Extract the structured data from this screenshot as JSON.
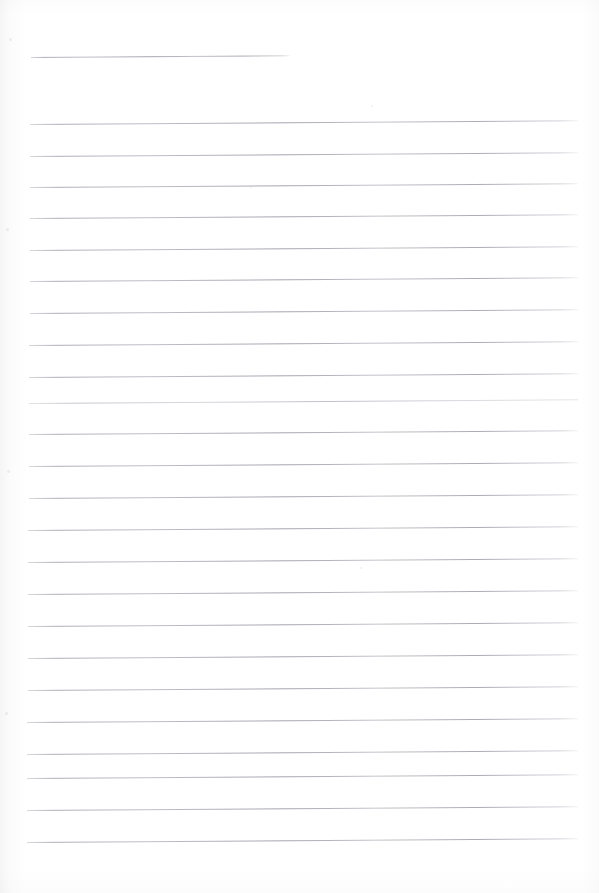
{
  "document": {
    "type": "scanned-ruled-paper",
    "title": "Blank lined notebook page",
    "page_width": 599,
    "page_height": 893,
    "background_color": "#ffffff",
    "rule_color": "#b4b4bd",
    "content_text": "",
    "handwriting": "none",
    "skew_degrees": -0.38
  },
  "layout": {
    "left_margin_x": 30,
    "right_margin_x": 578,
    "first_line_y": 57,
    "line_spacing": 31.8,
    "total_lines": 25
  },
  "rules": [
    {
      "id": "rule-1",
      "y": 57,
      "x": 31,
      "width": 259,
      "kind": "short",
      "label": "heading-rule"
    },
    {
      "id": "rule-2",
      "y": 124,
      "x": 30,
      "width": 548,
      "kind": "full",
      "label": "body-rule"
    },
    {
      "id": "rule-3",
      "y": 156,
      "x": 30,
      "width": 548,
      "kind": "full",
      "label": "body-rule"
    },
    {
      "id": "rule-4",
      "y": 187,
      "x": 30,
      "width": 548,
      "kind": "full",
      "label": "body-rule"
    },
    {
      "id": "rule-5",
      "y": 218,
      "x": 30,
      "width": 548,
      "kind": "full",
      "label": "body-rule"
    },
    {
      "id": "rule-6",
      "y": 250,
      "x": 30,
      "width": 548,
      "kind": "full",
      "label": "body-rule"
    },
    {
      "id": "rule-7",
      "y": 281,
      "x": 30,
      "width": 548,
      "kind": "full",
      "label": "body-rule"
    },
    {
      "id": "rule-8",
      "y": 313,
      "x": 30,
      "width": 548,
      "kind": "full",
      "label": "body-rule"
    },
    {
      "id": "rule-9",
      "y": 345,
      "x": 29,
      "width": 549,
      "kind": "full",
      "label": "body-rule"
    },
    {
      "id": "rule-10",
      "y": 377,
      "x": 29,
      "width": 549,
      "kind": "full",
      "label": "body-rule"
    },
    {
      "id": "rule-11",
      "y": 403,
      "x": 29,
      "width": 549,
      "kind": "faint",
      "label": "body-rule"
    },
    {
      "id": "rule-12",
      "y": 434,
      "x": 29,
      "width": 549,
      "kind": "full",
      "label": "body-rule"
    },
    {
      "id": "rule-13",
      "y": 466,
      "x": 29,
      "width": 549,
      "kind": "full",
      "label": "body-rule"
    },
    {
      "id": "rule-14",
      "y": 498,
      "x": 29,
      "width": 549,
      "kind": "full",
      "label": "body-rule"
    },
    {
      "id": "rule-15",
      "y": 530,
      "x": 28,
      "width": 550,
      "kind": "full",
      "label": "body-rule"
    },
    {
      "id": "rule-16",
      "y": 562,
      "x": 28,
      "width": 550,
      "kind": "full",
      "label": "body-rule"
    },
    {
      "id": "rule-17",
      "y": 594,
      "x": 28,
      "width": 550,
      "kind": "full",
      "label": "body-rule"
    },
    {
      "id": "rule-18",
      "y": 626,
      "x": 28,
      "width": 550,
      "kind": "full",
      "label": "body-rule"
    },
    {
      "id": "rule-19",
      "y": 658,
      "x": 28,
      "width": 550,
      "kind": "full",
      "label": "body-rule"
    },
    {
      "id": "rule-20",
      "y": 690,
      "x": 28,
      "width": 550,
      "kind": "full",
      "label": "body-rule"
    },
    {
      "id": "rule-21",
      "y": 722,
      "x": 27,
      "width": 551,
      "kind": "full",
      "label": "body-rule"
    },
    {
      "id": "rule-22",
      "y": 754,
      "x": 27,
      "width": 551,
      "kind": "full",
      "label": "body-rule"
    },
    {
      "id": "rule-23",
      "y": 778,
      "x": 27,
      "width": 551,
      "kind": "full",
      "label": "body-rule"
    },
    {
      "id": "rule-24",
      "y": 810,
      "x": 27,
      "width": 551,
      "kind": "full",
      "label": "body-rule"
    },
    {
      "id": "rule-25",
      "y": 842,
      "x": 27,
      "width": 551,
      "kind": "full",
      "label": "body-rule"
    }
  ],
  "specks": [
    {
      "x": 371,
      "y": 105,
      "size": 2
    },
    {
      "x": 360,
      "y": 567,
      "size": 2
    },
    {
      "x": 9,
      "y": 38,
      "size": 3
    },
    {
      "x": 6,
      "y": 228,
      "size": 3
    },
    {
      "x": 7,
      "y": 470,
      "size": 3
    },
    {
      "x": 5,
      "y": 712,
      "size": 3
    },
    {
      "x": 250,
      "y": 186,
      "size": 2
    }
  ]
}
